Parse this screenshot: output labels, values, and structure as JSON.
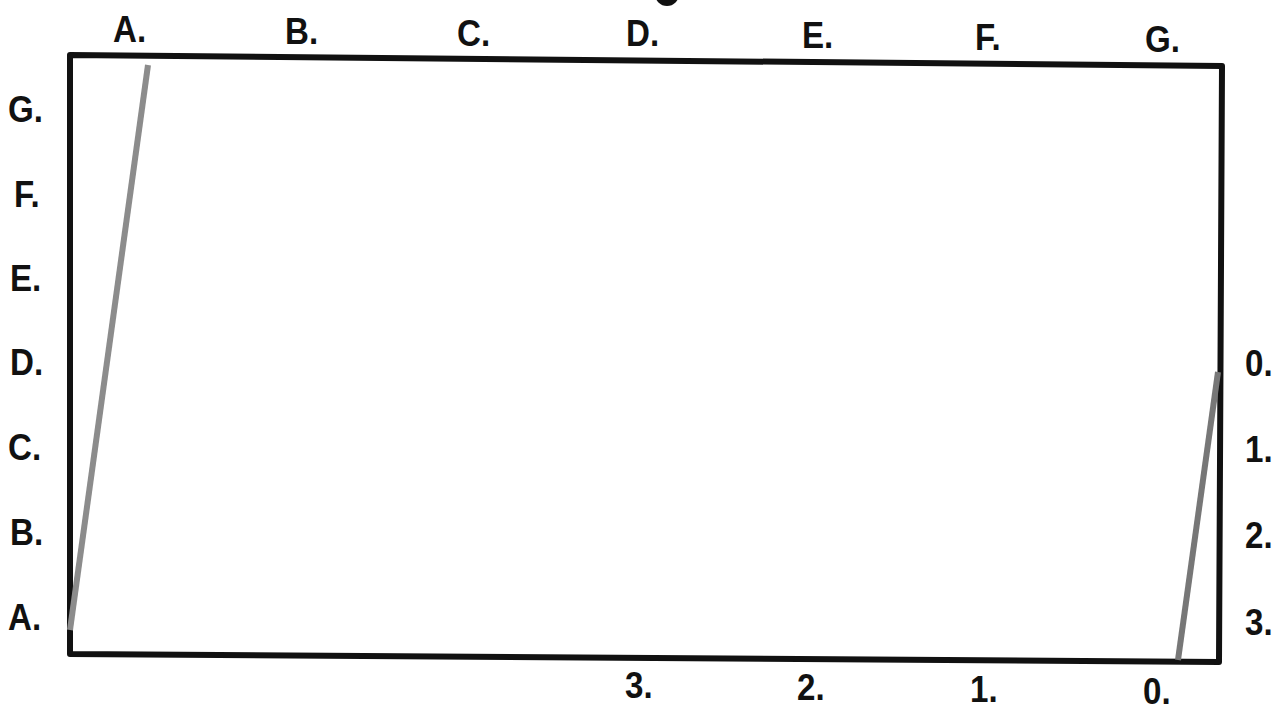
{
  "title_fragment": "",
  "top_labels": [
    {
      "text": "A.",
      "x": 113,
      "y": 12
    },
    {
      "text": "B.",
      "x": 285,
      "y": 14
    },
    {
      "text": "C.",
      "x": 457,
      "y": 16
    },
    {
      "text": "D.",
      "x": 626,
      "y": 16
    },
    {
      "text": "E.",
      "x": 802,
      "y": 18
    },
    {
      "text": "F.",
      "x": 975,
      "y": 20
    },
    {
      "text": "G.",
      "x": 1145,
      "y": 22
    }
  ],
  "left_labels": [
    {
      "text": "G.",
      "x": 8,
      "y": 92
    },
    {
      "text": "F.",
      "x": 14,
      "y": 177
    },
    {
      "text": "E.",
      "x": 10,
      "y": 261
    },
    {
      "text": "D.",
      "x": 10,
      "y": 345
    },
    {
      "text": "C.",
      "x": 8,
      "y": 430
    },
    {
      "text": "B.",
      "x": 10,
      "y": 515
    },
    {
      "text": "A.",
      "x": 8,
      "y": 600
    }
  ],
  "right_labels": [
    {
      "text": "0.",
      "x": 1245,
      "y": 346
    },
    {
      "text": "1.",
      "x": 1245,
      "y": 432
    },
    {
      "text": "2.",
      "x": 1245,
      "y": 518
    },
    {
      "text": "3.",
      "x": 1245,
      "y": 605
    }
  ],
  "bottom_labels": [
    {
      "text": "3.",
      "x": 625,
      "y": 668
    },
    {
      "text": "2.",
      "x": 797,
      "y": 670
    },
    {
      "text": "1.",
      "x": 970,
      "y": 672
    },
    {
      "text": "0.",
      "x": 1143,
      "y": 674
    }
  ],
  "frame": {
    "points": "70,55 1222,66 1219,662 70,654",
    "stroke": "#111111",
    "stroke_width": 6
  },
  "lines": [
    {
      "name": "left-gray-line",
      "x1": 70,
      "y1": 630,
      "x2": 148,
      "y2": 65,
      "color": "#8c8c8c",
      "width": 6
    },
    {
      "name": "right-gray-line",
      "x1": 1218,
      "y1": 372,
      "x2": 1178,
      "y2": 660,
      "color": "#777777",
      "width": 6
    }
  ]
}
